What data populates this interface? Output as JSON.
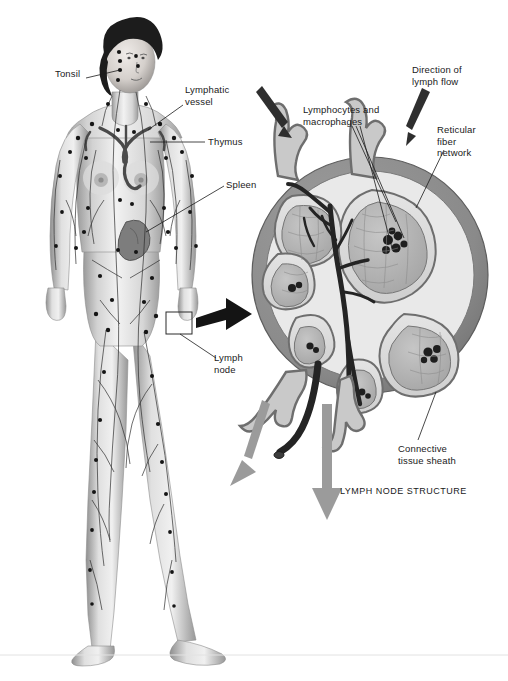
{
  "figure": {
    "title_panel": "LYMPH NODE STRUCTURE",
    "background_color": "#ffffff",
    "ink_color": "#1a1a1a",
    "capsule_color": "#8a8a8a",
    "sinus_color": "#d8d8d8",
    "lobule_color": "#b5b5b5",
    "arrow_gray": "#9b9b9b",
    "arrow_dark": "#3a3a3a",
    "skin_light": "#ededed",
    "skin_shade": "#a8a8a8",
    "hair_color": "#1c1c1c"
  },
  "body_diagram": {
    "name": "female-lymphatic-system",
    "labels": [
      {
        "id": "tonsil",
        "text": "Tonsil",
        "x": 55,
        "y": 74
      },
      {
        "id": "lymphatic-vessel",
        "text": "Lymphatic\nvessel",
        "x": 185,
        "y": 90
      },
      {
        "id": "thymus",
        "text": "Thymus",
        "x": 208,
        "y": 138
      },
      {
        "id": "spleen",
        "text": "Spleen",
        "x": 226,
        "y": 181
      },
      {
        "id": "lymph-node",
        "text": "Lymph\nnode",
        "x": 218,
        "y": 352
      }
    ]
  },
  "node_diagram": {
    "name": "lymph-node-cross-section",
    "title": "LYMPH NODE STRUCTURE",
    "labels": [
      {
        "id": "direction-of-lymph-flow",
        "text": "Direction of\nlymph flow",
        "x": 416,
        "y": 66
      },
      {
        "id": "lymphocytes-and-macrophages",
        "text": "Lymphocytes and\nmacrophages",
        "x": 303,
        "y": 106
      },
      {
        "id": "reticular-fiber-network",
        "text": "Reticular\nfiber\nnetwork",
        "x": 437,
        "y": 126
      },
      {
        "id": "connective-tissue-sheath",
        "text": "Connective\ntissue sheath",
        "x": 400,
        "y": 445
      }
    ]
  },
  "caption": {
    "text": ""
  }
}
